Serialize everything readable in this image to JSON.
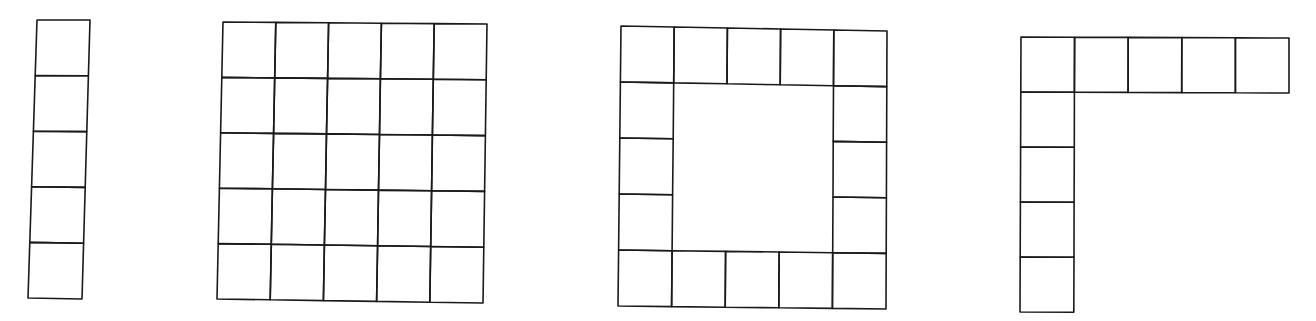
{
  "diagram": {
    "stroke_color": "#1a1a1a",
    "background_color": "#ffffff",
    "figures": [
      {
        "id": "column",
        "label": "5x1 column of squares",
        "cell_count": 5,
        "corners": {
          "tl": [
            37,
            20
          ],
          "tr": [
            90,
            20
          ],
          "br": [
            82,
            299
          ],
          "bl": [
            28,
            298
          ]
        },
        "rows": 5,
        "cols": 1,
        "cells": [
          [
            0,
            0
          ],
          [
            1,
            0
          ],
          [
            2,
            0
          ],
          [
            3,
            0
          ],
          [
            4,
            0
          ]
        ]
      },
      {
        "id": "full-grid",
        "label": "5x5 full grid",
        "cell_count": 25,
        "corners": {
          "tl": [
            223,
            22
          ],
          "tr": [
            487,
            24
          ],
          "br": [
            483,
            303
          ],
          "bl": [
            217,
            299
          ]
        },
        "rows": 5,
        "cols": 5,
        "cells": "all"
      },
      {
        "id": "ring",
        "label": "5x5 border ring (hollow square)",
        "cell_count": 16,
        "corners": {
          "tl": [
            621,
            26
          ],
          "tr": [
            887,
            31
          ],
          "br": [
            886,
            309
          ],
          "bl": [
            618,
            306
          ]
        },
        "rows": 5,
        "cols": 5,
        "cells": "border"
      },
      {
        "id": "l-shape",
        "label": "L-shape: top row of 5 plus left column of 4",
        "cell_count": 9,
        "corners": {
          "tl": [
            1021,
            37
          ],
          "tr": [
            1289,
            38
          ],
          "br": [
            1289,
            313
          ],
          "bl": [
            1020,
            312
          ]
        },
        "rows": 5,
        "cols": 5,
        "cells": "L"
      }
    ]
  }
}
